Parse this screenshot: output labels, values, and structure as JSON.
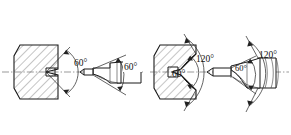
{
  "drawing": {
    "title": "Center drill and center hole angle comparison",
    "background_color": "#ffffff",
    "line_color": "#1a1a1a",
    "centerline_color": "#555555",
    "figures": [
      {
        "id": "figure-left",
        "name": "60 degree center hole and drill",
        "workpiece": {
          "name": "hatched-workpiece-block",
          "hatch_angle_deg": 45,
          "hole_type": "conical center hole"
        },
        "tool": {
          "name": "center-drill-tool",
          "point_angle_label": "60°"
        },
        "dimensions": [
          {
            "id": "dim-left-hole",
            "label": "60°",
            "target": "center hole cone angle"
          },
          {
            "id": "dim-left-tool",
            "label": "60°",
            "target": "drill point angle"
          }
        ]
      },
      {
        "id": "figure-right",
        "name": "60 and 120 degree center hole and drill",
        "workpiece": {
          "name": "hatched-workpiece-block",
          "hatch_angle_deg": 45,
          "hole_type": "conical center hole with 120 degree countersink"
        },
        "tool": {
          "name": "center-drill-tool",
          "point_angle_label": "60°",
          "countersink_angle_label": "120°"
        },
        "dimensions": [
          {
            "id": "dim-right-hole-60",
            "label": "60°",
            "target": "center hole cone angle"
          },
          {
            "id": "dim-right-hole-120",
            "label": "120°",
            "target": "countersink angle on workpiece"
          },
          {
            "id": "dim-right-tool-60",
            "label": "60°",
            "target": "drill point angle"
          },
          {
            "id": "dim-right-tool-120",
            "label": "120°",
            "target": "drill countersink angle"
          }
        ]
      }
    ],
    "labels": {
      "left_hole_angle": "60°",
      "left_tool_angle": "60°",
      "right_hole_angle": "60°",
      "right_hole_countersink": "120°",
      "right_tool_angle": "60°",
      "right_tool_countersink": "120°"
    }
  }
}
